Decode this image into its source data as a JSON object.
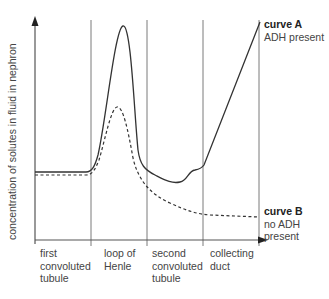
{
  "diagram": {
    "y_axis_label": "concentration of solutes in fluid in nephron",
    "segments": [
      {
        "label_lines": [
          "first",
          "convoluted",
          "tubule"
        ]
      },
      {
        "label_lines": [
          "loop of",
          "Henle"
        ]
      },
      {
        "label_lines": [
          "second",
          "convoluted",
          "tubule"
        ]
      },
      {
        "label_lines": [
          "collecting",
          "duct"
        ]
      }
    ],
    "curves": [
      {
        "name": "curve A",
        "description": "ADH present",
        "style": "solid"
      },
      {
        "name": "curve B",
        "description": "no ADH present",
        "description_lines": [
          "no ADH",
          "present"
        ],
        "style": "dashed"
      }
    ],
    "colors": {
      "axis": "#555555",
      "divider": "#777777",
      "curve": "#333333",
      "text": "#444444"
    }
  }
}
